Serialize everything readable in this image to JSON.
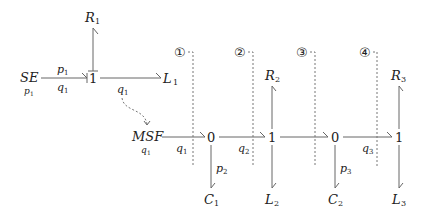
{
  "diagram": {
    "type": "bond-graph",
    "elements": {
      "source_effort": {
        "label": "SE",
        "sub": "p",
        "sub_index": "1"
      },
      "junction_1a": {
        "label": "1"
      },
      "r1": {
        "label": "R",
        "index": "1"
      },
      "l1": {
        "label": "L",
        "index": "1"
      },
      "msf": {
        "label": "MSF",
        "sub": "q",
        "sub_index": "1"
      },
      "junction_0a": {
        "label": "0"
      },
      "c1": {
        "label": "C",
        "index": "1"
      },
      "junction_1b": {
        "label": "1"
      },
      "r2": {
        "label": "R",
        "index": "2"
      },
      "l2": {
        "label": "L",
        "index": "2"
      },
      "junction_0b": {
        "label": "0"
      },
      "c2": {
        "label": "C",
        "index": "2"
      },
      "junction_1c": {
        "label": "1"
      },
      "r3": {
        "label": "R",
        "index": "3"
      },
      "l3": {
        "label": "L",
        "index": "3"
      }
    },
    "bond_labels": {
      "se_p": {
        "var": "p",
        "index": "1"
      },
      "se_q": {
        "var": "q",
        "index": "1"
      },
      "l1_q": {
        "var": "q",
        "index": "1"
      },
      "msf_q": {
        "var": "q",
        "index": "1"
      },
      "c1_p": {
        "var": "p",
        "index": "2"
      },
      "j0a_j1b_q": {
        "var": "q",
        "index": "2"
      },
      "c2_p": {
        "var": "p",
        "index": "3"
      },
      "j0b_j1c_q": {
        "var": "q",
        "index": "3"
      }
    },
    "cut_markers": [
      "①",
      "②",
      "③",
      "④"
    ]
  }
}
